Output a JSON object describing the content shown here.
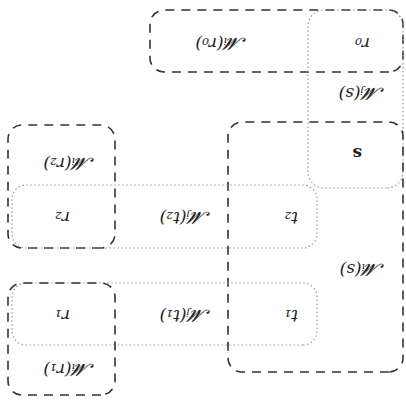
{
  "diagram": {
    "orientation": "rotated 180 degrees",
    "labels": {
      "Mi_r0": "𝓜ᵢ(r₀)",
      "r0": "r₀",
      "Mj_s": "𝓜ⱼ(s)",
      "s": "s",
      "Mi_r2": "𝓜ᵢ(r₂)",
      "r2": "r₂",
      "Mj_t2": "𝓜ⱼ(t₂)",
      "t2": "t₂",
      "Mi_s": "𝓜ᵢ(s)",
      "r1": "r₁",
      "Mj_t1": "𝓜ⱼ(t₁)",
      "t1": "t₁",
      "Mi_r1": "𝓜ᵢ(r₁)"
    },
    "styles": {
      "dashed_stroke": "#333333",
      "dotted_stroke": "#999999"
    }
  }
}
